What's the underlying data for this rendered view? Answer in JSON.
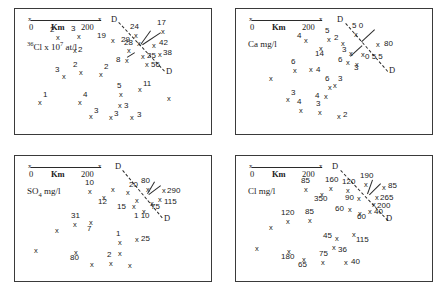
{
  "figure": {
    "scale": {
      "tick_mark": "x",
      "zero": "0",
      "unit_label": "Km",
      "max": "200"
    },
    "dashed_line_label": "D"
  },
  "chart_data": {
    "type": "scatter",
    "panels": [
      {
        "id": "panel-cl36",
        "unit_html": "<sup>36</sup>Cl x 10<sup>7</sup> at/l",
        "unit_text": "36Cl x 107 at/l",
        "points": [
          {
            "x": 41,
            "y": 25,
            "v": "2",
            "lx": -6,
            "ly": -8
          },
          {
            "x": 62,
            "y": 24,
            "v": "3",
            "lx": -6,
            "ly": -8
          },
          {
            "x": 58,
            "y": 38,
            "v": "2",
            "lx": 5,
            "ly": -1
          },
          {
            "x": 96,
            "y": 28,
            "v": "19",
            "lx": -14,
            "ly": -5
          },
          {
            "x": 119,
            "y": 23,
            "v": "24",
            "lx": -4,
            "ly": -9
          },
          {
            "x": 146,
            "y": 19,
            "v": "17",
            "lx": -4,
            "ly": -9
          },
          {
            "x": 122,
            "y": 31,
            "v": "29",
            "lx": -16,
            "ly": -4
          },
          {
            "x": 137,
            "y": 33,
            "v": "42",
            "lx": 7,
            "ly": -3
          },
          {
            "x": 112,
            "y": 38,
            "v": "28",
            "lx": -3,
            "ly": -8
          },
          {
            "x": 126,
            "y": 44,
            "v": "25",
            "lx": 6,
            "ly": -1
          },
          {
            "x": 143,
            "y": 42,
            "v": "38",
            "lx": 5,
            "ly": -2
          },
          {
            "x": 110,
            "y": 48,
            "v": "8",
            "lx": -9,
            "ly": -1
          },
          {
            "x": 130,
            "y": 52,
            "v": "56",
            "lx": 6,
            "ly": 0
          },
          {
            "x": 47,
            "y": 64,
            "v": "3",
            "lx": -7,
            "ly": -7
          },
          {
            "x": 64,
            "y": 60,
            "v": "2",
            "lx": -6,
            "ly": -8
          },
          {
            "x": 84,
            "y": 62,
            "v": "2",
            "lx": 5,
            "ly": -8
          },
          {
            "x": 23,
            "y": 90,
            "v": "1",
            "lx": 5,
            "ly": -8
          },
          {
            "x": 63,
            "y": 90,
            "v": "4",
            "lx": 5,
            "ly": -8
          },
          {
            "x": 104,
            "y": 82,
            "v": "5",
            "lx": -2,
            "ly": -9
          },
          {
            "x": 123,
            "y": 77,
            "v": "11",
            "lx": 5,
            "ly": -6
          },
          {
            "x": 152,
            "y": 86,
            "v": "",
            "lx": 0,
            "ly": 0
          },
          {
            "x": 103,
            "y": 93,
            "v": "3",
            "lx": 6,
            "ly": 0
          },
          {
            "x": 74,
            "y": 104,
            "v": "3",
            "lx": 5,
            "ly": -6
          },
          {
            "x": 94,
            "y": 105,
            "v": "3",
            "lx": 5,
            "ly": -4
          },
          {
            "x": 115,
            "y": 105,
            "v": "3",
            "lx": 7,
            "ly": -3
          }
        ],
        "dlines": [
          {
            "x1": 104,
            "y1": 13,
            "x2": 150,
            "y2": 62,
            "top_label_x": 96,
            "top_label_y": 6,
            "bot_label_x": 151,
            "bot_label_y": 58
          }
        ],
        "leaders": [
          {
            "x1": 136,
            "y1": 22,
            "x2": 126,
            "y2": 36
          },
          {
            "x1": 146,
            "y1": 24,
            "x2": 128,
            "y2": 36
          },
          {
            "x1": 120,
            "y1": 44,
            "x2": 112,
            "y2": 49
          }
        ]
      },
      {
        "id": "panel-ca",
        "unit_html": "Ca mg/l",
        "unit_text": "Ca mg/l",
        "points": [
          {
            "x": 68,
            "y": 28,
            "v": "4",
            "lx": -7,
            "ly": -5
          },
          {
            "x": 91,
            "y": 27,
            "v": "5",
            "lx": -2,
            "ly": -9
          },
          {
            "x": 83,
            "y": 36,
            "v": "14",
            "lx": -4,
            "ly": 5
          },
          {
            "x": 105,
            "y": 31,
            "v": "2",
            "lx": -7,
            "ly": -6
          },
          {
            "x": 118,
            "y": 22,
            "v": "5 0",
            "lx": -2,
            "ly": -9
          },
          {
            "x": 140,
            "y": 32,
            "v": "80",
            "lx": 8,
            "ly": -1
          },
          {
            "x": 113,
            "y": 41,
            "v": "3",
            "lx": -7,
            "ly": -4
          },
          {
            "x": 125,
            "y": 42,
            "v": "0 5 5",
            "lx": 4,
            "ly": 2
          },
          {
            "x": 110,
            "y": 50,
            "v": "6",
            "lx": -8,
            "ly": -3
          },
          {
            "x": 119,
            "y": 52,
            "v": "3",
            "lx": -1,
            "ly": 3
          },
          {
            "x": 57,
            "y": 58,
            "v": "6",
            "lx": -2,
            "ly": -9
          },
          {
            "x": 73,
            "y": 57,
            "v": "4",
            "lx": 7,
            "ly": 0
          },
          {
            "x": 33,
            "y": 66,
            "v": "",
            "lx": 0,
            "ly": 0
          },
          {
            "x": 97,
            "y": 73,
            "v": "3",
            "lx": 5,
            "ly": -7
          },
          {
            "x": 92,
            "y": 75,
            "v": "6",
            "lx": -3,
            "ly": -9
          },
          {
            "x": 88,
            "y": 84,
            "v": "4",
            "lx": -9,
            "ly": -1
          },
          {
            "x": 50,
            "y": 87,
            "v": "3",
            "lx": 5,
            "ly": -7
          },
          {
            "x": 63,
            "y": 98,
            "v": "4",
            "lx": -2,
            "ly": -9
          },
          {
            "x": 82,
            "y": 100,
            "v": "3",
            "lx": -2,
            "ly": -9
          },
          {
            "x": 101,
            "y": 104,
            "v": "2",
            "lx": 6,
            "ly": -2
          }
        ],
        "dlines": [
          {
            "x1": 110,
            "y1": 14,
            "x2": 152,
            "y2": 62,
            "top_label_x": 101,
            "top_label_y": 6,
            "bot_label_x": 153,
            "bot_label_y": 57
          }
        ],
        "leaders": [
          {
            "x1": 139,
            "y1": 21,
            "x2": 126,
            "y2": 33
          },
          {
            "x1": 114,
            "y1": 47,
            "x2": 126,
            "y2": 36
          }
        ]
      },
      {
        "id": "panel-so4",
        "unit_html": "SO<sub>4</sub> mg/l",
        "unit_text": "SO4 mg/l",
        "points": [
          {
            "x": 73,
            "y": 32,
            "v": "10",
            "lx": -3,
            "ly": -9
          },
          {
            "x": 96,
            "y": 30,
            "v": "",
            "lx": 0,
            "ly": 0
          },
          {
            "x": 87,
            "y": 38,
            "v": "12",
            "lx": -4,
            "ly": 4
          },
          {
            "x": 111,
            "y": 33,
            "v": "20",
            "lx": 3,
            "ly": -8
          },
          {
            "x": 131,
            "y": 30,
            "v": "80",
            "lx": -5,
            "ly": -9
          },
          {
            "x": 147,
            "y": 31,
            "v": "290",
            "lx": 5,
            "ly": 0
          },
          {
            "x": 143,
            "y": 40,
            "v": "115",
            "lx": 6,
            "ly": 2
          },
          {
            "x": 120,
            "y": 41,
            "v": "",
            "lx": 0,
            "ly": 0
          },
          {
            "x": 135,
            "y": 44,
            "v": "75",
            "lx": 1,
            "ly": 3
          },
          {
            "x": 117,
            "y": 47,
            "v": "15",
            "lx": -15,
            "ly": 0
          },
          {
            "x": 127,
            "y": 52,
            "v": "1 10",
            "lx": -8,
            "ly": 4
          },
          {
            "x": 58,
            "y": 65,
            "v": "31",
            "lx": -2,
            "ly": -9
          },
          {
            "x": 74,
            "y": 63,
            "v": "7",
            "lx": -2,
            "ly": 6
          },
          {
            "x": 40,
            "y": 71,
            "v": "",
            "lx": 0,
            "ly": 0
          },
          {
            "x": 103,
            "y": 83,
            "v": "1",
            "lx": -2,
            "ly": -9
          },
          {
            "x": 120,
            "y": 80,
            "v": "25",
            "lx": 6,
            "ly": -1
          },
          {
            "x": 19,
            "y": 91,
            "v": "",
            "lx": 0,
            "ly": 0
          },
          {
            "x": 103,
            "y": 94,
            "v": "",
            "lx": 0,
            "ly": 0
          },
          {
            "x": 59,
            "y": 93,
            "v": "80",
            "lx": -4,
            "ly": 5
          },
          {
            "x": 75,
            "y": 105,
            "v": "",
            "lx": 0,
            "ly": 0
          },
          {
            "x": 94,
            "y": 104,
            "v": "2",
            "lx": -2,
            "ly": -9
          },
          {
            "x": 113,
            "y": 106,
            "v": "",
            "lx": 0,
            "ly": 0
          }
        ],
        "dlines": [
          {
            "x1": 108,
            "y1": 14,
            "x2": 148,
            "y2": 62,
            "top_label_x": 100,
            "top_label_y": 6,
            "bot_label_x": 149,
            "bot_label_y": 58
          }
        ],
        "leaders": [
          {
            "x1": 140,
            "y1": 26,
            "x2": 133,
            "y2": 38
          },
          {
            "x1": 146,
            "y1": 30,
            "x2": 134,
            "y2": 39
          }
        ]
      },
      {
        "id": "panel-cl",
        "unit_html": "Cl mg/l",
        "unit_text": "Cl mg/l",
        "points": [
          {
            "x": 68,
            "y": 30,
            "v": "85",
            "lx": -3,
            "ly": -9
          },
          {
            "x": 93,
            "y": 29,
            "v": "160",
            "lx": -4,
            "ly": -9
          },
          {
            "x": 84,
            "y": 35,
            "v": "350",
            "lx": -6,
            "ly": 4
          },
          {
            "x": 110,
            "y": 31,
            "v": "120",
            "lx": -4,
            "ly": -9
          },
          {
            "x": 128,
            "y": 25,
            "v": "190",
            "lx": -4,
            "ly": -9
          },
          {
            "x": 146,
            "y": 28,
            "v": "85",
            "lx": 6,
            "ly": -2
          },
          {
            "x": 121,
            "y": 39,
            "v": "90",
            "lx": -12,
            "ly": -1
          },
          {
            "x": 139,
            "y": 38,
            "v": "265",
            "lx": 5,
            "ly": 0
          },
          {
            "x": 136,
            "y": 45,
            "v": "200",
            "lx": 5,
            "ly": 1
          },
          {
            "x": 132,
            "y": 52,
            "v": "40",
            "lx": 6,
            "ly": 0
          },
          {
            "x": 112,
            "y": 50,
            "v": "60",
            "lx": -13,
            "ly": -1
          },
          {
            "x": 122,
            "y": 54,
            "v": "60",
            "lx": -1,
            "ly": 3
          },
          {
            "x": 50,
            "y": 62,
            "v": "120",
            "lx": -5,
            "ly": -9
          },
          {
            "x": 72,
            "y": 61,
            "v": "85",
            "lx": -3,
            "ly": -9
          },
          {
            "x": 33,
            "y": 68,
            "v": "",
            "lx": 0,
            "ly": 0
          },
          {
            "x": 99,
            "y": 79,
            "v": "45",
            "lx": -12,
            "ly": -3
          },
          {
            "x": 116,
            "y": 75,
            "v": "115",
            "lx": 4,
            "ly": 5
          },
          {
            "x": 96,
            "y": 88,
            "v": "36",
            "lx": 6,
            "ly": 2
          },
          {
            "x": 19,
            "y": 89,
            "v": "",
            "lx": 0,
            "ly": 0
          },
          {
            "x": 51,
            "y": 92,
            "v": "180",
            "lx": -6,
            "ly": 5
          },
          {
            "x": 66,
            "y": 100,
            "v": "65",
            "lx": -4,
            "ly": 5
          },
          {
            "x": 85,
            "y": 103,
            "v": "75",
            "lx": -2,
            "ly": -9
          },
          {
            "x": 108,
            "y": 103,
            "v": "40",
            "lx": 7,
            "ly": -1
          }
        ],
        "dlines": [
          {
            "x1": 105,
            "y1": 14,
            "x2": 152,
            "y2": 64,
            "top_label_x": 96,
            "top_label_y": 6,
            "bot_label_x": 150,
            "bot_label_y": 58
          }
        ],
        "leaders": [
          {
            "x1": 137,
            "y1": 24,
            "x2": 132,
            "y2": 38
          },
          {
            "x1": 145,
            "y1": 28,
            "x2": 134,
            "y2": 39
          }
        ]
      }
    ]
  }
}
